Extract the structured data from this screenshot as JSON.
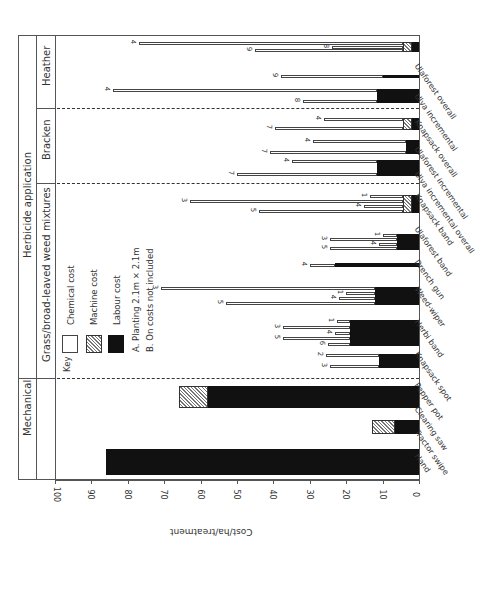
{
  "chart_data": {
    "type": "bar",
    "orientation": "rotated-90",
    "stacked": true,
    "title": "",
    "ylabel": "Cost/ha/treatment",
    "xlabel": "",
    "ylim": [
      0,
      100
    ],
    "yticks": [
      "0",
      "10",
      "20",
      "30",
      "40",
      "50",
      "60",
      "70",
      "80",
      "90",
      "100"
    ],
    "header_bands": [
      {
        "label": "Mechanical",
        "spans": [
          "Hand",
          "Tractor swipe",
          "Clearing saw"
        ]
      },
      {
        "label": "Herbicide application",
        "spans": [
          "Pepper pot",
          "Knapsack spot",
          "Herbi band",
          "Weed-wiper",
          "Drench gun",
          "Ulaforest band",
          "Knapsack band",
          "Ulva incremental",
          "Ulaforest overall",
          "Ulva incremental",
          "Knapsack overall",
          "Ulaforest incremental",
          "Ulaforest overall"
        ]
      }
    ],
    "sub_bands": [
      {
        "label": "Grass/broad-leaved weed mixtures"
      },
      {
        "label": "Bracken"
      },
      {
        "label": "Heather"
      }
    ],
    "legend": {
      "title": "Key",
      "items": [
        {
          "name": "Chemical cost",
          "pattern": "white"
        },
        {
          "name": "Machine cost",
          "pattern": "hatched"
        },
        {
          "name": "Labour cost",
          "pattern": "black"
        }
      ],
      "notes": [
        "A. Planting 2.1m × 2.1m",
        "B. On costs not included"
      ]
    },
    "categories": [
      "Hand",
      "Tractor swipe",
      "Clearing saw",
      "Pepper pot",
      "Knapsack spot",
      "Herbi band",
      "Weed-wiper",
      "Drench gun",
      "Ulaforest band",
      "Knapsack band",
      "Ulva incremental",
      "Ulaforest overall",
      "Knapsack overall",
      "Ulva incremental",
      "Ulaforest overall"
    ],
    "groups": [
      {
        "category": "Hand",
        "section": "Mechanical",
        "labour": 86,
        "machine": 0,
        "chemical": []
      },
      {
        "category": "Clearing saw",
        "section": "Mechanical",
        "labour": 6.5,
        "machine": 6.5,
        "chemical": []
      },
      {
        "category": "Tractor swipe",
        "section": "Mechanical",
        "labour": 58,
        "machine": 8,
        "chemical": []
      },
      {
        "category": "Pepper pot",
        "section": "Grass/broad-leaved weed mixtures",
        "labour": 11,
        "machine": 0,
        "chemical": [
          {
            "label": "2",
            "total": 25.5
          },
          {
            "label": "3",
            "total": 24.5
          }
        ]
      },
      {
        "category": "Knapsack spot",
        "section": "Grass/broad-leaved weed mixtures",
        "labour": 19,
        "machine": 0,
        "chemical": [
          {
            "label": "1",
            "total": 22.5
          },
          {
            "label": "3",
            "total": 37.5
          },
          {
            "label": "4",
            "total": 23
          },
          {
            "label": "5",
            "total": 37.5
          },
          {
            "label": "6",
            "total": 25
          }
        ]
      },
      {
        "category": "Herbi band",
        "section": "Grass/broad-leaved weed mixtures",
        "labour": 12,
        "machine": 0,
        "chemical": [
          {
            "label": "3",
            "total": 71
          },
          {
            "label": "1",
            "total": 20
          },
          {
            "label": "4",
            "total": 22
          },
          {
            "label": "5",
            "total": 53
          }
        ]
      },
      {
        "category": "Weed-wiper",
        "section": "Grass/broad-leaved weed mixtures",
        "labour": 23,
        "machine": 0,
        "chemical": [
          {
            "label": "4",
            "total": 30
          }
        ]
      },
      {
        "category": "Drench gun",
        "section": "Grass/broad-leaved weed mixtures",
        "labour": 6,
        "machine": 0,
        "chemical": [
          {
            "label": "1",
            "total": 10
          },
          {
            "label": "3",
            "total": 24.5
          },
          {
            "label": "4",
            "total": 11
          },
          {
            "label": "5",
            "total": 24.5
          }
        ]
      },
      {
        "category": "Ulaforest band",
        "section": "Grass/broad-leaved weed mixtures",
        "labour": 2,
        "machine": 2.5,
        "chemical": [
          {
            "label": "1",
            "total": 13.5
          },
          {
            "label": "3",
            "total": 63
          },
          {
            "label": "4",
            "total": 15
          },
          {
            "label": "5",
            "total": 44
          }
        ]
      },
      {
        "category": "Knapsack band",
        "section": "Bracken",
        "labour": 11.5,
        "machine": 0,
        "chemical": [
          {
            "label": "4",
            "total": 35
          },
          {
            "label": "7",
            "total": 50
          }
        ]
      },
      {
        "category": "Ulva incremental",
        "section": "Bracken",
        "labour": 3.5,
        "machine": 0,
        "chemical": [
          {
            "label": "4",
            "total": 29
          },
          {
            "label": "7",
            "total": 41
          }
        ]
      },
      {
        "category": "Knapsack overall",
        "section": "Bracken",
        "labour": 2,
        "machine": 2.5,
        "chemical": [
          {
            "label": "4",
            "total": 26
          },
          {
            "label": "7",
            "total": 39.5
          }
        ]
      },
      {
        "category": "Ulva incremental",
        "section": "Heather",
        "labour": 11.5,
        "machine": 0,
        "chemical": [
          {
            "label": "4",
            "total": 84
          },
          {
            "label": "8",
            "total": 32
          }
        ]
      },
      {
        "category": "Ulaforest incremental",
        "section": "Heather",
        "labour": 10,
        "machine": 0,
        "chemical": [
          {
            "label": "9",
            "total": 38
          }
        ]
      },
      {
        "category": "Ulaforest overall",
        "section": "Heather",
        "labour": 2,
        "machine": 2.5,
        "chemical": [
          {
            "label": "4",
            "total": 77
          },
          {
            "label": "8",
            "total": 24
          },
          {
            "label": "9",
            "total": 45
          }
        ]
      }
    ]
  },
  "labels": {
    "ylabel": "Cost/ha/treatment",
    "band_mechanical": "Mechanical",
    "band_herbicide": "Herbicide application",
    "band_grass": "Grass/broad-leaved weed mixtures",
    "band_bracken": "Bracken",
    "band_heather": "Heather",
    "key_title": "Key",
    "key_chemical": "Chemical cost",
    "key_machine": "Machine cost",
    "key_labour": "Labour cost",
    "note_a": "A. Planting 2.1m × 2.1m",
    "note_b": "B. On costs not included",
    "ticks": [
      "0",
      "10",
      "20",
      "30",
      "40",
      "50",
      "60",
      "70",
      "80",
      "90",
      "100"
    ],
    "cats": [
      "Hand",
      "Tractor swipe",
      "Clearing saw",
      "Pepper pot",
      "Knapsack spot",
      "Herbi band",
      "Weed-wiper",
      "Drench gun",
      "Ulaforest band",
      "Knapsack band",
      "Ulva incremental overall",
      "Ulaforest incremental",
      "Knapsack overall",
      "Ulva incremental",
      "Ulaforest overall"
    ]
  }
}
